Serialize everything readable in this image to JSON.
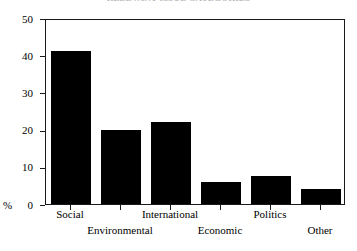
{
  "chart_data": {
    "type": "bar",
    "title": "RELEVANT ISSUE CATEGORIES",
    "xlabel": "",
    "ylabel": "%",
    "categories": [
      "Social",
      "Environmental",
      "International",
      "Economic",
      "Politics",
      "Other"
    ],
    "values": [
      41,
      20,
      22,
      6,
      7.5,
      4
    ],
    "ylim": [
      0,
      50
    ],
    "yticks": [
      0,
      10,
      20,
      30,
      40,
      50
    ],
    "ytick_labels": [
      "0",
      "10",
      "20",
      "30",
      "40",
      "50"
    ],
    "grid": false,
    "legend": null,
    "bar_color": "#000000",
    "frame_color": "#1a1a1a",
    "label_rows": [
      0,
      1,
      0,
      1,
      0,
      1
    ]
  },
  "axis": {
    "y_unit": "%"
  }
}
